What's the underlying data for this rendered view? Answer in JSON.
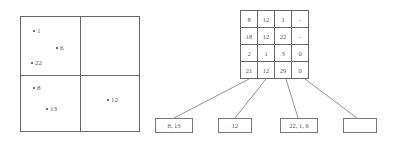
{
  "quadtree_region": {
    "quadrants": [
      "top-left",
      "top-right",
      "bottom-left",
      "bottom-right"
    ],
    "points": [
      {
        "label": "1",
        "x": 12,
        "y": 14
      },
      {
        "label": "6",
        "x": 35,
        "y": 32
      },
      {
        "label": "22",
        "x": 10,
        "y": 46
      },
      {
        "label": "8",
        "x": 12,
        "y": 72
      },
      {
        "label": "13",
        "x": 25,
        "y": 93
      },
      {
        "label": "12",
        "x": 86,
        "y": 84
      }
    ]
  },
  "grid_table": {
    "rows": [
      [
        "8",
        "12",
        "1",
        "-"
      ],
      [
        "18",
        "12",
        "22",
        "-"
      ],
      [
        "2",
        "1",
        "3",
        "0"
      ],
      [
        "21",
        "12",
        "29",
        "0"
      ]
    ]
  },
  "leaves": [
    {
      "label": "8, 13"
    },
    {
      "label": "12"
    },
    {
      "label": "22, 1, 6"
    },
    {
      "label": ""
    }
  ],
  "colors": {
    "line": "#666666",
    "text": "#555555",
    "background": "#ffffff"
  }
}
